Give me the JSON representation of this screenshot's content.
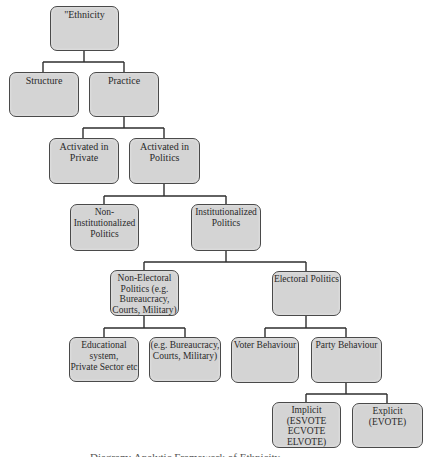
{
  "diagram": {
    "type": "tree",
    "nodes": {
      "ethnicity": {
        "label": "\"Ethnicity"
      },
      "structure": {
        "label": "Structure"
      },
      "practice": {
        "label": "Practice"
      },
      "activated_private": {
        "label": "Activated in\nPrivate"
      },
      "activated_politics": {
        "label": "Activated in\nPolitics"
      },
      "non_institutionalized": {
        "label": "Non-\nInstitutionalized\nPolitics"
      },
      "institutionalized": {
        "label": "Institutionalized\nPolitics"
      },
      "non_electoral": {
        "label": "Non-Electoral\nPolitics (e.g.\nBureaucracy,\nCourts, Military)"
      },
      "electoral": {
        "label": "Electoral Politics"
      },
      "educational": {
        "label": "Educational\nsystem,\nPrivate Sector etc"
      },
      "eg_bureaucracy": {
        "label": "(e.g. Bureaucracy,\nCourts, Military)"
      },
      "voter_behaviour": {
        "label": "Voter Behaviour"
      },
      "party_behaviour": {
        "label": "Party Behaviour"
      },
      "implicit": {
        "label": "Implicit\n(ESVOTE\nECVOTE\nELVOTE)"
      },
      "explicit": {
        "label": "Explicit\n(EVOTE)"
      }
    },
    "edges": [
      [
        "ethnicity",
        "structure"
      ],
      [
        "ethnicity",
        "practice"
      ],
      [
        "practice",
        "activated_private"
      ],
      [
        "practice",
        "activated_politics"
      ],
      [
        "activated_politics",
        "non_institutionalized"
      ],
      [
        "activated_politics",
        "institutionalized"
      ],
      [
        "institutionalized",
        "non_electoral"
      ],
      [
        "institutionalized",
        "electoral"
      ],
      [
        "non_electoral",
        "educational"
      ],
      [
        "non_electoral",
        "eg_bureaucracy"
      ],
      [
        "electoral",
        "voter_behaviour"
      ],
      [
        "electoral",
        "party_behaviour"
      ],
      [
        "party_behaviour",
        "implicit"
      ],
      [
        "party_behaviour",
        "explicit"
      ]
    ],
    "colors": {
      "node_fill": "#d4d4d4",
      "node_border": "#4a4a4a",
      "connector": "#2e2e2e",
      "text": "#2a2a2a"
    }
  },
  "caption": {
    "text": "Diagram: Analytic Framework of Ethnicity"
  }
}
